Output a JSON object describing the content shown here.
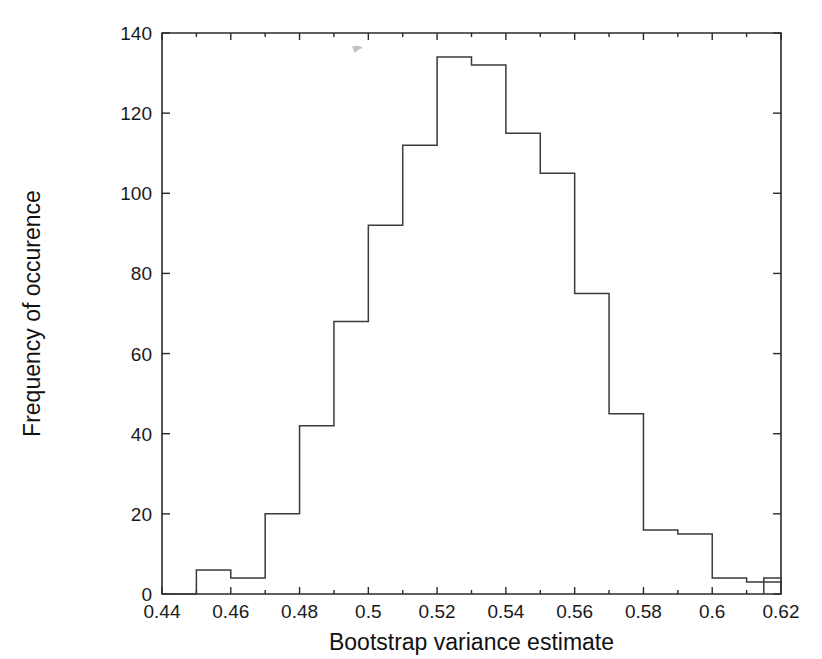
{
  "chart_data": {
    "type": "bar",
    "title": "",
    "subtitle": "",
    "xlabel": "Bootstrap variance estimate",
    "ylabel": "Frequency of occurence",
    "xlim": [
      0.44,
      0.62
    ],
    "ylim": [
      0,
      140
    ],
    "grid": false,
    "legend": null,
    "bin_width": 0.01,
    "x_tick_labels": [
      "0.44",
      "0.46",
      "0.48",
      "0.5",
      "0.52",
      "0.54",
      "0.56",
      "0.58",
      "0.6",
      "0.62"
    ],
    "x_tick_values": [
      0.44,
      0.46,
      0.48,
      0.5,
      0.52,
      0.54,
      0.56,
      0.58,
      0.6,
      0.62
    ],
    "x_minor_tick_values": [
      0.45,
      0.47,
      0.49,
      0.51,
      0.53,
      0.55,
      0.57,
      0.59,
      0.61
    ],
    "y_tick_labels": [
      "0",
      "20",
      "40",
      "60",
      "80",
      "100",
      "120",
      "140"
    ],
    "y_tick_values": [
      0,
      20,
      40,
      60,
      80,
      100,
      120,
      140
    ],
    "bin_edges": [
      0.44,
      0.45,
      0.46,
      0.47,
      0.48,
      0.49,
      0.5,
      0.51,
      0.52,
      0.53,
      0.54,
      0.55,
      0.56,
      0.57,
      0.58,
      0.59,
      0.6,
      0.61,
      0.62
    ],
    "bin_centers": [
      0.445,
      0.455,
      0.465,
      0.475,
      0.485,
      0.495,
      0.505,
      0.515,
      0.525,
      0.535,
      0.545,
      0.555,
      0.565,
      0.575,
      0.585,
      0.595,
      0.605,
      0.615
    ],
    "categories": [
      "0.44-0.45",
      "0.45-0.46",
      "0.46-0.47",
      "0.47-0.48",
      "0.48-0.49",
      "0.49-0.50",
      "0.50-0.51",
      "0.51-0.52",
      "0.52-0.53",
      "0.53-0.54",
      "0.54-0.55",
      "0.55-0.56",
      "0.56-0.57",
      "0.57-0.58",
      "0.58-0.59",
      "0.59-0.60",
      "0.60-0.61",
      "0.61-0.62"
    ],
    "values": [
      0,
      6,
      4,
      20,
      42,
      68,
      92,
      112,
      134,
      132,
      115,
      105,
      75,
      45,
      16,
      15,
      4,
      3
    ],
    "extra_tail_bins": {
      "edges": [
        0.605,
        0.615,
        0.625
      ],
      "values": [
        0,
        1
      ]
    },
    "colors": {
      "bar_stroke": "#3a3a3a",
      "bar_fill": "none",
      "axis": "#2b2b2b",
      "text": "#1a1a1a",
      "background": "#ffffff"
    }
  },
  "axes": {
    "x_title": "Bootstrap variance estimate",
    "y_title": "Frequency of occurence"
  }
}
